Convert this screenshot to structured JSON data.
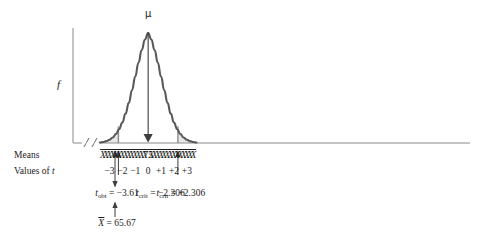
{
  "figure": {
    "axes": {
      "y_label": "f",
      "x_break_marks": "//",
      "row_label_means": "Means",
      "row_label_values": "Values of t",
      "row_label_values_italic_part": "t"
    },
    "center": {
      "mu_symbol": "μ",
      "center_mean_value": "75",
      "center_t_value": "0"
    },
    "mean_symbol": "X̄",
    "tick_count": 29,
    "t_labels": [
      "−3",
      "−2",
      "−1",
      "0",
      "+1",
      "+2",
      "+3"
    ],
    "annotations": [
      {
        "name": "t-obt",
        "text": "t_obt = −3.61",
        "base": "t",
        "sub": "obt",
        "value": "= −3.61"
      },
      {
        "name": "t-crit-lower",
        "text": "t_crit = −2.306",
        "base": "t",
        "sub": "crit",
        "value": "= −2.306"
      },
      {
        "name": "t-crit-upper",
        "text": "t_crit = +2.306",
        "base": "t",
        "sub": "crit",
        "value": "= +2.306"
      },
      {
        "name": "sample-mean",
        "text": "X̄ = 65.67",
        "value": "= 65.67"
      }
    ],
    "colors": {
      "curve": "#595959",
      "axis": "#8a8a8a",
      "critical_line": "#8a8a8a",
      "tail_fill": "#e8e8e8",
      "text": "#1b1b1b",
      "arrow": "#3d3d3d"
    }
  },
  "chart_data": {
    "type": "line",
    "title": "",
    "xlabel": "Values of t",
    "ylabel": "f",
    "distribution": "normal sampling distribution of means",
    "mu": 75,
    "xlim": [
      -3.75,
      3.75
    ],
    "ylim": [
      0,
      1
    ],
    "grid": false,
    "legend": null,
    "x_tick_values": [
      -3,
      -2,
      -1,
      0,
      1,
      2,
      3
    ],
    "x_tick_labels": [
      "−3",
      "−2",
      "−1",
      "0",
      "+1",
      "+2",
      "+3"
    ],
    "mean_tick_positions": [
      -3.5,
      -3.25,
      -3,
      -2.75,
      -2.5,
      -2.25,
      -2,
      -1.75,
      -1.5,
      -1.25,
      -1,
      -0.75,
      -0.5,
      -0.25,
      0,
      0.25,
      0.5,
      0.75,
      1,
      1.25,
      1.5,
      1.75,
      2,
      2.25,
      2.5,
      2.75,
      3,
      3.25,
      3.5
    ],
    "t_obt": -3.61,
    "t_crit_lower": -2.306,
    "t_crit_upper": 2.306,
    "sample_mean": 65.67,
    "rejection_regions": [
      {
        "side": "lower",
        "from": -3.75,
        "to": -2.306
      },
      {
        "side": "upper",
        "from": 2.306,
        "to": 3.75
      }
    ],
    "curve_points": [
      {
        "t": -3.75,
        "y": 0.0091
      },
      {
        "t": -3.5,
        "y": 0.0175
      },
      {
        "t": -3.25,
        "y": 0.0323
      },
      {
        "t": -3.0,
        "y": 0.057
      },
      {
        "t": -2.75,
        "y": 0.0963
      },
      {
        "t": -2.5,
        "y": 0.1558
      },
      {
        "t": -2.25,
        "y": 0.242
      },
      {
        "t": -2.0,
        "y": 0.3606
      },
      {
        "t": -1.75,
        "y": 0.5157
      },
      {
        "t": -1.5,
        "y": 0.7066
      },
      {
        "t": -1.25,
        "y": 0.9275
      },
      {
        "t": -1.0,
        "y": 1.1671
      },
      {
        "t": -0.75,
        "y": 1.4094
      },
      {
        "t": -0.5,
        "y": 1.6337
      },
      {
        "t": -0.25,
        "y": 1.8166
      },
      {
        "t": 0.0,
        "y": 1.9333
      },
      {
        "t": 0.25,
        "y": 1.8166
      },
      {
        "t": 0.5,
        "y": 1.6337
      },
      {
        "t": 0.75,
        "y": 1.4094
      },
      {
        "t": 1.0,
        "y": 1.1671
      },
      {
        "t": 1.25,
        "y": 0.9275
      },
      {
        "t": 1.5,
        "y": 0.7066
      },
      {
        "t": 1.75,
        "y": 0.5157
      },
      {
        "t": 2.0,
        "y": 0.3606
      },
      {
        "t": 2.25,
        "y": 0.242
      },
      {
        "t": 2.5,
        "y": 0.1558
      },
      {
        "t": 2.75,
        "y": 0.0963
      },
      {
        "t": 3.0,
        "y": 0.057
      },
      {
        "t": 3.25,
        "y": 0.0323
      },
      {
        "t": 3.5,
        "y": 0.0175
      },
      {
        "t": 3.75,
        "y": 0.0091
      }
    ]
  }
}
